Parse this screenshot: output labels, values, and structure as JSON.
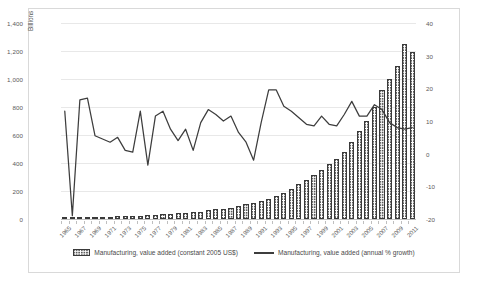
{
  "axes": {
    "y_left_label": "Billions",
    "y_left_ticks": [
      "1,400",
      "1,200",
      "1,000",
      "800",
      "600",
      "400",
      "200",
      "0"
    ],
    "y_right_ticks": [
      "40",
      "30",
      "20",
      "10",
      "0",
      "-10",
      "-20"
    ],
    "x_ticks": [
      "1965",
      "1967",
      "1969",
      "1971",
      "1973",
      "1975",
      "1977",
      "1979",
      "1981",
      "1983",
      "1985",
      "1987",
      "1989",
      "1991",
      "1993",
      "1995",
      "1997",
      "1999",
      "2001",
      "2003",
      "2005",
      "2007",
      "2009",
      "2011"
    ]
  },
  "legend": {
    "items": [
      {
        "label": "Manufacturing, value added (constant 2005 US$)",
        "marker": "bar-swatch-icon"
      },
      {
        "label": "Manufacturing, value added (annual % growth)",
        "marker": "line-swatch-icon"
      }
    ]
  },
  "colors": {
    "bar_fill": "#5c5c5c",
    "bar_border": "#3a3a3a",
    "line": "#3d3d3d",
    "grid": "#e8e8e8",
    "axis_text": "#5a5a5a",
    "frame_border": "#d9d9d9",
    "background": "#ffffff"
  },
  "chart_data": {
    "type": "bar",
    "title": "",
    "xlabel": "",
    "ylabel": "Billions",
    "grid": true,
    "legend_position": "bottom",
    "x": [
      1965,
      1966,
      1967,
      1968,
      1969,
      1970,
      1971,
      1972,
      1973,
      1974,
      1975,
      1976,
      1977,
      1978,
      1979,
      1980,
      1981,
      1982,
      1983,
      1984,
      1985,
      1986,
      1987,
      1988,
      1989,
      1990,
      1991,
      1992,
      1993,
      1994,
      1995,
      1996,
      1997,
      1998,
      1999,
      2000,
      2001,
      2002,
      2003,
      2004,
      2005,
      2006,
      2007,
      2008,
      2009,
      2010,
      2011
    ],
    "categories": [
      "1965",
      "1966",
      "1967",
      "1968",
      "1969",
      "1970",
      "1971",
      "1972",
      "1973",
      "1974",
      "1975",
      "1976",
      "1977",
      "1978",
      "1979",
      "1980",
      "1981",
      "1982",
      "1983",
      "1984",
      "1985",
      "1986",
      "1987",
      "1988",
      "1989",
      "1990",
      "1991",
      "1992",
      "1993",
      "1994",
      "1995",
      "1996",
      "1997",
      "1998",
      "1999",
      "2000",
      "2001",
      "2002",
      "2003",
      "2004",
      "2005",
      "2006",
      "2007",
      "2008",
      "2009",
      "2010",
      "2011"
    ],
    "axis_left": {
      "range": [
        0,
        1400
      ],
      "step": 200,
      "label": "Billions",
      "series": "Manufacturing, value added (constant 2005 US$)"
    },
    "axis_right": {
      "range": [
        -20,
        40
      ],
      "step": 10,
      "label": "",
      "series": "Manufacturing, value added (annual % growth)"
    },
    "series": [
      {
        "name": "Manufacturing, value added (constant 2005 US$)",
        "type": "bar",
        "axis": "left",
        "unit": "Billions",
        "values": [
          11,
          12,
          10,
          12,
          14,
          15,
          17,
          19,
          22,
          24,
          24,
          27,
          30,
          33,
          37,
          41,
          45,
          48,
          53,
          61,
          68,
          74,
          82,
          93,
          104,
          116,
          127,
          141,
          163,
          189,
          215,
          248,
          282,
          312,
          347,
          392,
          430,
          479,
          548,
          630,
          697,
          797,
          920,
          1003,
          1091,
          1249,
          1195
        ]
      },
      {
        "name": "Manufacturing, value added (annual % growth)",
        "type": "line",
        "axis": "right",
        "unit": "%",
        "values": [
          13.0,
          -19.0,
          16.5,
          17.0,
          5.5,
          4.5,
          3.5,
          5.0,
          1.0,
          0.5,
          13.0,
          -3.5,
          11.5,
          13.0,
          7.5,
          4.0,
          7.5,
          1.0,
          9.5,
          13.5,
          12.0,
          10.0,
          11.5,
          6.5,
          3.5,
          -2.0,
          9.5,
          19.5,
          19.5,
          14.5,
          13.0,
          11.0,
          9.0,
          8.5,
          11.5,
          9.0,
          8.5,
          12.0,
          16.0,
          11.5,
          11.5,
          15.0,
          13.5,
          9.5,
          8.0,
          7.5,
          8.0
        ]
      }
    ]
  }
}
